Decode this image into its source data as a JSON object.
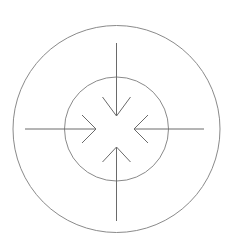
{
  "diagram": {
    "type": "converging-arrows",
    "colors": {
      "background": "#ffffff",
      "circle_stroke": "#8a8a8a",
      "arrow_stroke": "#6a6a6a"
    },
    "center": {
      "x": 116.5,
      "y": 129
    },
    "circles": [
      {
        "name": "outer-circle",
        "r": 103.5
      },
      {
        "name": "inner-circle",
        "r": 52
      }
    ],
    "arrows": [
      {
        "name": "arrow-from-top",
        "direction": "down",
        "from": {
          "x": 116.5,
          "y": 43
        },
        "tip": {
          "x": 116.5,
          "y": 116
        },
        "barbs": [
          {
            "x": 102.5,
            "y": 97
          },
          {
            "x": 130.5,
            "y": 97
          }
        ]
      },
      {
        "name": "arrow-from-bottom",
        "direction": "up",
        "from": {
          "x": 116.5,
          "y": 221
        },
        "tip": {
          "x": 116.5,
          "y": 147
        },
        "barbs": [
          {
            "x": 102.5,
            "y": 162
          },
          {
            "x": 130.5,
            "y": 162
          }
        ]
      },
      {
        "name": "arrow-from-left",
        "direction": "right",
        "from": {
          "x": 25,
          "y": 129
        },
        "tip": {
          "x": 96,
          "y": 129
        },
        "barbs": [
          {
            "x": 82,
            "y": 115
          },
          {
            "x": 82,
            "y": 143
          }
        ]
      },
      {
        "name": "arrow-from-right",
        "direction": "left",
        "from": {
          "x": 204,
          "y": 129
        },
        "tip": {
          "x": 134,
          "y": 129
        },
        "barbs": [
          {
            "x": 148,
            "y": 115
          },
          {
            "x": 148,
            "y": 143
          }
        ]
      }
    ]
  }
}
